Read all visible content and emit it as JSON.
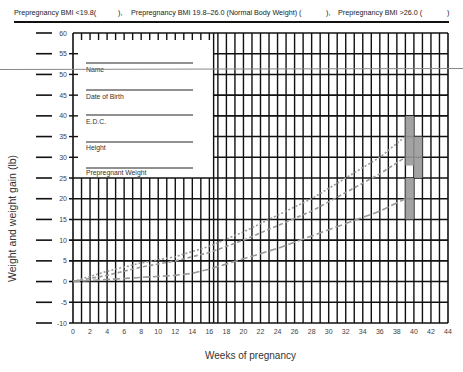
{
  "header": {
    "bmi_low": "Prepregnancy BMI <19.8(",
    "bmi_low_close": "),",
    "bmi_normal": "Prepregnancy BMI 19.8–26.0 (Normal Body Weight) (",
    "bmi_normal_close": "),",
    "bmi_high": "Prepregnancy BMI >26.0 (",
    "bmi_high_close": ")"
  },
  "form_fields": [
    {
      "label": "Name"
    },
    {
      "label": "Date of Birth"
    },
    {
      "label": "E.D.C."
    },
    {
      "label": "Height"
    },
    {
      "label": "Prepregnant Weight"
    }
  ],
  "chart_data": {
    "type": "line",
    "title": "",
    "xlabel": "Weeks of pregnancy",
    "ylabel": "Weight and weight gain (lb)",
    "xlim": [
      0,
      44
    ],
    "ylim": [
      -10,
      60
    ],
    "x_ticks": [
      0,
      2,
      4,
      6,
      8,
      10,
      12,
      14,
      16,
      18,
      20,
      22,
      24,
      26,
      28,
      30,
      32,
      34,
      36,
      38,
      40,
      42,
      44
    ],
    "y_ticks": [
      60,
      55,
      50,
      45,
      40,
      35,
      30,
      25,
      20,
      15,
      10,
      5,
      0,
      -5,
      -10
    ],
    "grid": true,
    "series": [
      {
        "name": "Prepregnancy BMI <19.8 (dotted)",
        "style": "dotted",
        "x": [
          0,
          4,
          8,
          12,
          16,
          20,
          24,
          28,
          32,
          36,
          39
        ],
        "y": [
          0,
          2.5,
          4.5,
          6,
          8.5,
          12,
          16,
          20,
          25,
          30,
          35
        ]
      },
      {
        "name": "Prepregnancy BMI 19.8-26.0 (short dash)",
        "style": "dashed",
        "x": [
          0,
          4,
          8,
          12,
          16,
          20,
          24,
          28,
          32,
          36,
          39
        ],
        "y": [
          0,
          1.5,
          3.5,
          5,
          7,
          10,
          13.5,
          17,
          21.5,
          26,
          30
        ]
      },
      {
        "name": "Prepregnancy BMI >26.0 (long dash)",
        "style": "longdash",
        "x": [
          0,
          4,
          8,
          12,
          14,
          16,
          20,
          24,
          28,
          32,
          36,
          39
        ],
        "y": [
          0,
          0.5,
          1,
          1.5,
          2,
          3,
          5.5,
          8,
          11,
          14,
          17,
          20
        ]
      }
    ],
    "target_bars": [
      {
        "name": "BMI <19.8 target range at 40 wks",
        "x": 39.5,
        "y_range": [
          28,
          40
        ]
      },
      {
        "name": "BMI 19.8-26.0 target range at 40 wks",
        "x": 40.5,
        "y_range": [
          25,
          35
        ]
      },
      {
        "name": "BMI >26.0 target range at 40 wks",
        "x": 39.5,
        "y_range": [
          15,
          25
        ]
      }
    ]
  }
}
